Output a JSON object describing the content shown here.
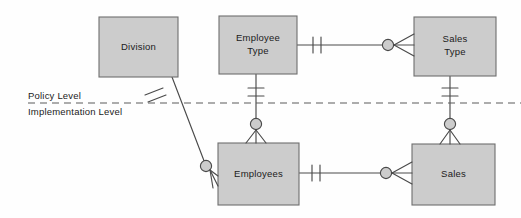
{
  "diagram": {
    "type": "entity-relationship-diagram",
    "notation": "crows-foot",
    "canvas": {
      "width": 521,
      "height": 218
    },
    "style": {
      "background": "#fefefe",
      "entity_fill": "#cccccc",
      "entity_stroke": "#6e6e6e",
      "line_color": "#4a4a4a",
      "divider_color": "#5a5a5a",
      "text_color": "#1b1b1b"
    },
    "levels": [
      {
        "id": "policy",
        "label": "Policy Level",
        "position": "above-divider"
      },
      {
        "id": "implementation",
        "label": "Implementation Level",
        "position": "below-divider"
      }
    ],
    "divider": {
      "style": "dashed",
      "y": 103
    },
    "entities": [
      {
        "id": "division",
        "label": "Division",
        "lines": [
          "Division"
        ],
        "level": "policy",
        "x": 99,
        "y": 17,
        "w": 79,
        "h": 60
      },
      {
        "id": "employee_type",
        "label": "Employee Type",
        "lines": [
          "Employee",
          "Type"
        ],
        "level": "policy",
        "x": 219,
        "y": 16,
        "w": 78,
        "h": 58
      },
      {
        "id": "sales_type",
        "label": "Sales Type",
        "lines": [
          "Sales",
          "Type"
        ],
        "level": "policy",
        "x": 414,
        "y": 17,
        "w": 82,
        "h": 59
      },
      {
        "id": "employees",
        "label": "Employees",
        "lines": [
          "Employees"
        ],
        "level": "implementation",
        "x": 218,
        "y": 143,
        "w": 81,
        "h": 62
      },
      {
        "id": "sales",
        "label": "Sales",
        "lines": [
          "Sales"
        ],
        "level": "implementation",
        "x": 412,
        "y": 144,
        "w": 83,
        "h": 61
      }
    ],
    "relationships": [
      {
        "id": "employee_type-sales_type",
        "from": "employee_type",
        "to": "sales_type",
        "orientation": "horizontal",
        "from_cardinality": "one-and-only-one",
        "to_cardinality": "zero-or-many"
      },
      {
        "id": "employees-sales",
        "from": "employees",
        "to": "sales",
        "orientation": "horizontal",
        "from_cardinality": "one-and-only-one",
        "to_cardinality": "zero-or-many"
      },
      {
        "id": "employee_type-employees",
        "from": "employee_type",
        "to": "employees",
        "orientation": "vertical",
        "crosses_divider": true,
        "from_cardinality": "one-and-only-one",
        "to_cardinality": "zero-or-many"
      },
      {
        "id": "sales_type-sales",
        "from": "sales_type",
        "to": "sales",
        "orientation": "vertical",
        "crosses_divider": true,
        "from_cardinality": "one-and-only-one",
        "to_cardinality": "zero-or-many"
      },
      {
        "id": "division-employees",
        "from": "division",
        "to": "employees",
        "orientation": "diagonal",
        "crosses_divider": true,
        "from_cardinality": "one-and-only-one",
        "to_cardinality": "zero-or-many"
      }
    ]
  }
}
